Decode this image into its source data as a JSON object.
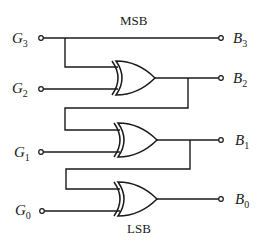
{
  "diagram": {
    "msb_label": "MSB",
    "lsb_label": "LSB",
    "inputs": [
      {
        "name": "G",
        "sub": "3"
      },
      {
        "name": "G",
        "sub": "2"
      },
      {
        "name": "G",
        "sub": "1"
      },
      {
        "name": "G",
        "sub": "0"
      }
    ],
    "outputs": [
      {
        "name": "B",
        "sub": "3"
      },
      {
        "name": "B",
        "sub": "2"
      },
      {
        "name": "B",
        "sub": "1"
      },
      {
        "name": "B",
        "sub": "0"
      }
    ],
    "gates": [
      {
        "type": "XOR",
        "inputs": [
          "G3",
          "G2"
        ],
        "output": "B2"
      },
      {
        "type": "XOR",
        "inputs": [
          "B2",
          "G1"
        ],
        "output": "B1"
      },
      {
        "type": "XOR",
        "inputs": [
          "B1",
          "G0"
        ],
        "output": "B0"
      }
    ],
    "colors": {
      "ink": "#1a1a1a",
      "background": "#ffffff"
    }
  }
}
